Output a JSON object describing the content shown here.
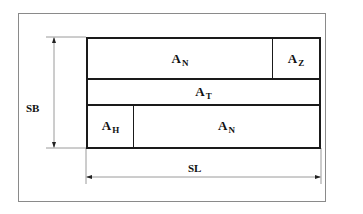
{
  "diagram": {
    "cells": {
      "row1_main": {
        "label": "A",
        "sub": "N"
      },
      "row1_side": {
        "label": "A",
        "sub": "Z"
      },
      "row2": {
        "label": "A",
        "sub": "T"
      },
      "row3_side": {
        "label": "A",
        "sub": "H"
      },
      "row3_main": {
        "label": "A",
        "sub": "N"
      }
    },
    "dimensions": {
      "height_label": "SB",
      "width_label": "SL"
    },
    "colors": {
      "box_stroke": "#1a1a1a",
      "frame_stroke": "#8a8a8a",
      "dimension_stroke": "#9a9a9a"
    }
  }
}
